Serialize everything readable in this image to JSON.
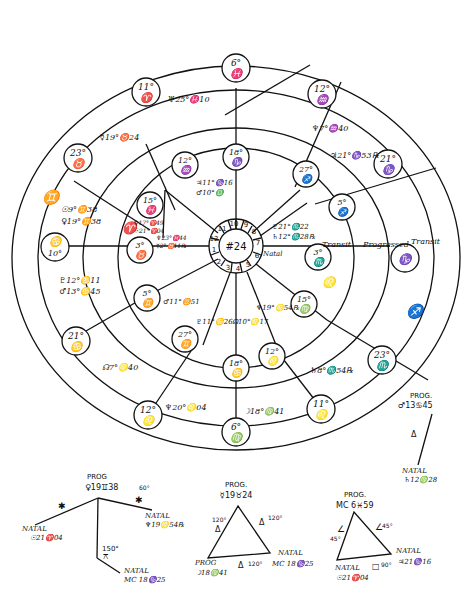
{
  "wheel": {
    "center_label": "#24",
    "houses": [
      "1",
      "2",
      "3",
      "4",
      "5",
      "6",
      "7",
      "8",
      "9",
      "10",
      "11",
      "12"
    ],
    "ring_labels": {
      "natal": "Natal",
      "transit_inner": "Transit",
      "progressed": "Progressed",
      "transit_outer": "Transit"
    },
    "outer_cusps": [
      {
        "deg": "6°",
        "sign": "♓"
      },
      {
        "deg": "12°",
        "sign": "♒"
      },
      {
        "deg": "21°",
        "sign": "♑"
      },
      {
        "deg": "",
        "sign": "♑"
      },
      {
        "deg": "23°",
        "sign": "♏"
      },
      {
        "deg": "11°",
        "sign": "♌"
      },
      {
        "deg": "6°",
        "sign": "♍"
      },
      {
        "deg": "12°",
        "sign": "♌"
      },
      {
        "deg": "21°",
        "sign": "♋"
      },
      {
        "deg": "10°",
        "sign": "♋"
      },
      {
        "deg": "23°",
        "sign": "♉"
      },
      {
        "deg": "11°",
        "sign": "♈"
      }
    ],
    "inner_cusps": [
      {
        "deg": "18°",
        "sign": "♑"
      },
      {
        "deg": "27°",
        "sign": "♐"
      },
      {
        "deg": "5°",
        "sign": "♐"
      },
      {
        "deg": "3°",
        "sign": "♏"
      },
      {
        "deg": "15°",
        "sign": "♍"
      },
      {
        "deg": "12°",
        "sign": "♌"
      },
      {
        "deg": "18°",
        "sign": "♋"
      },
      {
        "deg": "27°",
        "sign": "♊"
      },
      {
        "deg": "5°",
        "sign": "♊"
      },
      {
        "deg": "3°",
        "sign": "♉"
      },
      {
        "deg": "15°",
        "sign": "♓"
      },
      {
        "deg": "12°",
        "sign": "♒"
      }
    ],
    "sign_markers": {
      "gemini_outer": "♊",
      "aries_inner": "♈",
      "leo_mid": "♌",
      "sagittarius_outer": "♐"
    },
    "planets": {
      "uranus": "♅25°♓10",
      "mercury_prog": "☿19°♉24",
      "venus_prog_outer": "♆7°♒40",
      "jupiter_outer": "♃21°♑53℞",
      "sun_prog": "☉9°♊38",
      "venus_prog": "♀19°♊38",
      "pluto_outer": "♇12°♋11",
      "mars_outer": "♂13°♋45",
      "node_outer": "☊7°♌40",
      "neptune_outer": "♆20°♌04",
      "moon_outer": "☽18°♍41",
      "saturn_outer": "♄8°♏54℞",
      "jupiter_inner": "♃11°♑16",
      "mars_inner_top": "♂10°♎",
      "venus_inner_a": "♀17°♈49",
      "sun_inner": "☉21°♈04",
      "neptune_inner": "♆23°♓44",
      "mercury_inner": "☿2°♉11℞",
      "mars_inner": "♂11°♊51",
      "pluto_inner": "♇11°♋26",
      "node_inner": "☊10°♌17",
      "neptune_inner_b": "♆19°♌54℞",
      "pluto_inner_right": "♇21°♏22",
      "saturn_inner_right": "♄12°♏28℞"
    }
  },
  "aspects": {
    "prog_mars": {
      "title": "PROG.",
      "planet": "♂13♋45",
      "aspect": "Δ",
      "natal_title": "NATAL",
      "natal_planet": "♄12♍28"
    },
    "venus_group": {
      "prog_title": "PROG",
      "prog_planet": "♀19♊38",
      "natal_sun_title": "NATAL",
      "natal_sun": "☉21♈04",
      "natal_neptune_title": "NATAL",
      "natal_neptune": "♆19♌54℞",
      "natal_mc_title": "NATAL",
      "natal_mc": "MC 18♑25",
      "sextile_label": "60°",
      "sextile_symbol": "✱",
      "sextile_symbol_left": "✱",
      "quincunx_label": "150°",
      "quincunx_symbol": "⚻"
    },
    "trine_triangle": {
      "top_title": "PROG.",
      "top_planet": "☿19♉24",
      "left_title": "PROG",
      "left_planet": "☽18♍41",
      "right_title": "NATAL",
      "right_planet": "MC 18♑25",
      "left_label": "120°",
      "right_label": "120°",
      "bottom_label": "120°",
      "symbol": "Δ"
    },
    "square_triangle": {
      "top_title": "PROG.",
      "top_planet": "MC 6♓59",
      "left_title": "NATAL",
      "left_planet": "☉21♈04",
      "right_title": "NATAL",
      "right_planet": "♃21♑16",
      "left_label": "45°",
      "right_label": "45°",
      "bottom_label": "90°",
      "semisquare": "∠",
      "square": "□"
    }
  }
}
